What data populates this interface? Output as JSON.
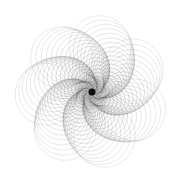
{
  "artwork": {
    "description": "Spirograph-style rosette of overlapping circles forming 7 curved spiral arms around a dark center",
    "background_color": "#ffffff",
    "stroke_color": "#555555",
    "center_color": "#111111",
    "center": [
      92,
      92
    ],
    "arms": 7,
    "circles_per_arm": 22,
    "max_offset": 46,
    "max_radius": 31,
    "twist_degrees": 95,
    "rotation_degrees": -80
  }
}
